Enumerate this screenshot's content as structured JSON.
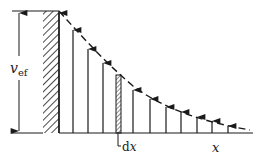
{
  "diagram": {
    "labels": {
      "v_main": "v",
      "v_sub": "ef",
      "dx": "dx",
      "x": "x"
    },
    "colors": {
      "ink": "#1a1a1a",
      "background": "#ffffff"
    },
    "baseline": {
      "x1": 59,
      "x2": 253,
      "y": 133
    },
    "wall": {
      "x": 43,
      "y": 11,
      "width": 16,
      "height": 122
    },
    "dimension_line": {
      "x": 19,
      "y_top": 11,
      "y_bottom": 133,
      "tick_x1": 12,
      "tick_x2": 59
    },
    "arrows": [
      {
        "x": 59,
        "top": 11
      },
      {
        "x": 73,
        "top": 28
      },
      {
        "x": 88,
        "top": 47
      },
      {
        "x": 103,
        "top": 61
      },
      {
        "x": 133,
        "top": 88
      },
      {
        "x": 150,
        "top": 97
      },
      {
        "x": 166,
        "top": 105
      },
      {
        "x": 181,
        "top": 110
      },
      {
        "x": 197,
        "top": 115
      },
      {
        "x": 212,
        "top": 119
      },
      {
        "x": 228,
        "top": 124
      }
    ],
    "dx_strip": {
      "x": 116,
      "width": 5,
      "top": 75
    },
    "envelope_curve": "exponential-decay dashed"
  }
}
